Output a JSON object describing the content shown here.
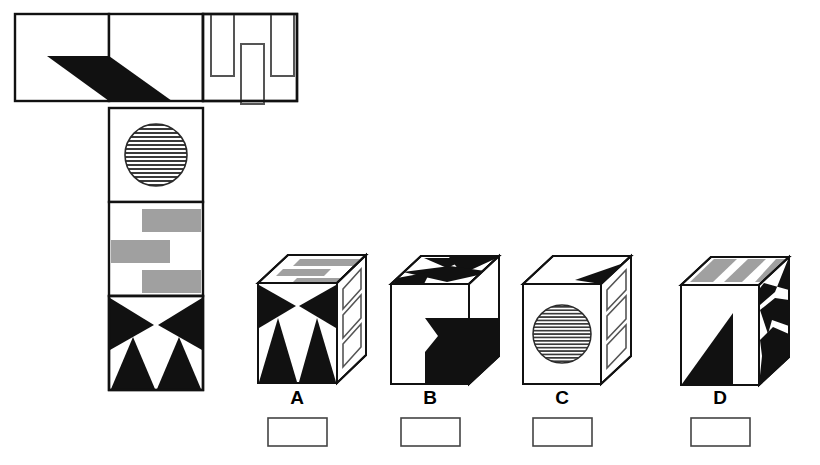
{
  "puzzle": {
    "kind": "cube-net-folding",
    "title": "",
    "colors": {
      "ink": "#000000",
      "paper": "#ffffff",
      "gray_fill": "#a0a0a0",
      "hatch_line": "#333333",
      "stroke": "#1a1a1a"
    },
    "net": {
      "name": "unfolded-cube-net",
      "cell_size": 94,
      "faces": [
        {
          "id": "net-face-top-left",
          "pattern": "black-parallelogram-left-half",
          "col": 0,
          "row": 0,
          "fill": "white"
        },
        {
          "id": "net-face-top-middle",
          "pattern": "black-parallelogram-right-half",
          "col": 1,
          "row": 0,
          "fill": "white"
        },
        {
          "id": "net-face-top-right",
          "pattern": "bracket-rectangles",
          "col": 2,
          "row": 0,
          "fill": "white"
        },
        {
          "id": "net-face-circle",
          "pattern": "hatched-circle",
          "col": 1,
          "row": 1,
          "fill": "white"
        },
        {
          "id": "net-face-bars",
          "pattern": "gray-zigzag-bars",
          "col": 1,
          "row": 2,
          "fill": "white"
        },
        {
          "id": "net-face-triangles",
          "pattern": "bowtie-and-two-triangles",
          "col": 1,
          "row": 3,
          "fill": "white"
        }
      ]
    },
    "options": [
      {
        "id": "option-a",
        "label": "A",
        "front_pattern": "bowtie-and-two-triangles",
        "top_pattern": "gray-zigzag-bars",
        "right_pattern": "bracket-rectangles",
        "answer_box_value": ""
      },
      {
        "id": "option-b",
        "label": "B",
        "front_pattern": "plain-white",
        "top_pattern": "black-zigzag-arrows",
        "right_pattern": "black-parallelogram",
        "answer_box_value": ""
      },
      {
        "id": "option-c",
        "label": "C",
        "front_pattern": "hatched-circle",
        "top_pattern": "black-wedge",
        "right_pattern": "bracket-rectangles",
        "answer_box_value": ""
      },
      {
        "id": "option-d",
        "label": "D",
        "front_pattern": "black-corner-arrow",
        "top_pattern": "gray-slanted-bars",
        "right_pattern": "black-zigzag-spikes",
        "answer_box_value": ""
      }
    ]
  }
}
